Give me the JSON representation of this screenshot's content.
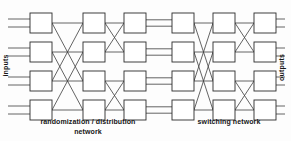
{
  "figure": {
    "kind": "interconnection-network-diagram",
    "width": 291,
    "height": 141,
    "background": "#fdfdfd",
    "line_color": "#3c3c3c",
    "box_fill": "#ffffff",
    "box_stroke": "#2b2b2b"
  },
  "labels": {
    "inputs": "inputs",
    "outputs": "outputs",
    "left_caption_line1": "randomization / distribution",
    "left_caption_line2": "network",
    "right_caption": "switching network"
  },
  "chart_data": {
    "type": "diagram",
    "title": "",
    "stages": [
      {
        "name": "randomization / distribution network",
        "columns": [
          1,
          2,
          3
        ]
      },
      {
        "name": "switching network",
        "columns": [
          4,
          5,
          6
        ]
      }
    ],
    "rows": 4,
    "columns": 6,
    "node_size": {
      "w": 22,
      "h": 20
    },
    "column_x": [
      30,
      83,
      124,
      172,
      213,
      254
    ],
    "row_y": [
      13,
      42,
      71,
      100
    ],
    "edge_patterns": [
      {
        "from_col": 1,
        "to_col": 2,
        "pattern": "span-2-crossbar",
        "pairs": [
          [
            1,
            3
          ],
          [
            3,
            1
          ],
          [
            2,
            4
          ],
          [
            4,
            2
          ],
          [
            1,
            1
          ],
          [
            2,
            2
          ],
          [
            3,
            3
          ],
          [
            4,
            4
          ]
        ]
      },
      {
        "from_col": 2,
        "to_col": 3,
        "pattern": "span-1-butterfly",
        "pairs": [
          [
            1,
            2
          ],
          [
            2,
            1
          ],
          [
            3,
            4
          ],
          [
            4,
            3
          ],
          [
            1,
            1
          ],
          [
            2,
            2
          ],
          [
            3,
            3
          ],
          [
            4,
            4
          ]
        ]
      },
      {
        "from_col": 3,
        "to_col": 4,
        "pattern": "straight-bus",
        "pairs": [
          [
            1,
            1
          ],
          [
            2,
            2
          ],
          [
            3,
            3
          ],
          [
            4,
            4
          ]
        ]
      },
      {
        "from_col": 4,
        "to_col": 5,
        "pattern": "span-2-crossbar",
        "pairs": [
          [
            1,
            3
          ],
          [
            3,
            1
          ],
          [
            2,
            4
          ],
          [
            4,
            2
          ],
          [
            1,
            1
          ],
          [
            2,
            2
          ],
          [
            3,
            3
          ],
          [
            4,
            4
          ]
        ]
      },
      {
        "from_col": 5,
        "to_col": 6,
        "pattern": "span-1-butterfly",
        "pairs": [
          [
            1,
            2
          ],
          [
            2,
            1
          ],
          [
            3,
            4
          ],
          [
            4,
            3
          ],
          [
            1,
            1
          ],
          [
            2,
            2
          ],
          [
            3,
            3
          ],
          [
            4,
            4
          ]
        ]
      }
    ],
    "terminals": {
      "input_lines_per_row": 2,
      "output_lines_per_row": 2,
      "input_x_start": 8,
      "output_x_end": 285
    }
  }
}
